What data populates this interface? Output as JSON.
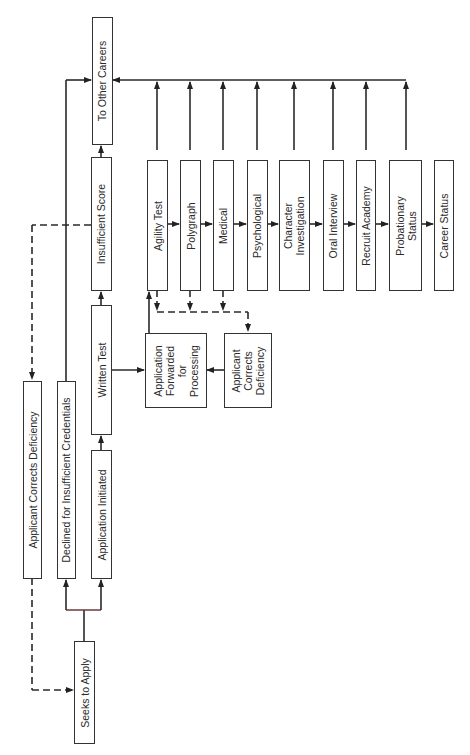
{
  "diagram": {
    "type": "flowchart",
    "orientation": "rotated-90-ccw",
    "nodes": {
      "to_other_careers": "To Other Careers",
      "insufficient_score": "Insufficient Score",
      "written_test": "Written Test",
      "application_initiated": "Application Initiated",
      "declined": "Declined for Insufficient Credentials",
      "applicant_corrects_1": "Applicant Corrects Deficiency",
      "seeks_to_apply": "Seeks to Apply",
      "app_forwarded": [
        "Application",
        "Forwarded",
        "for",
        "Processing"
      ],
      "applicant_corrects_2": [
        "Applicant",
        "Corrects",
        "Deficiency"
      ],
      "agility_test": "Agility Test",
      "polygraph": "Polygraph",
      "medical": "Medical",
      "psychological": "Psychological",
      "character_investigation": [
        "Character",
        "Investigation"
      ],
      "oral_interview": "Oral Interview",
      "recruit_academy": "Recruit Academy",
      "probationary_status": [
        "Probationary",
        "Status"
      ],
      "career_status": "Career Status"
    },
    "edges": [
      {
        "from": "Seeks to Apply",
        "to": "Declined for Insufficient Credentials",
        "style": "solid"
      },
      {
        "from": "Seeks to Apply",
        "to": "Application Initiated",
        "style": "solid"
      },
      {
        "from": "Declined for Insufficient Credentials",
        "to": "To Other Careers",
        "style": "solid"
      },
      {
        "from": "Application Initiated",
        "to": "Written Test",
        "style": "solid"
      },
      {
        "from": "Written Test",
        "to": "Insufficient Score",
        "style": "solid"
      },
      {
        "from": "Insufficient Score",
        "to": "To Other Careers",
        "style": "solid"
      },
      {
        "from": "Insufficient Score",
        "to": "Applicant Corrects Deficiency",
        "style": "dashed"
      },
      {
        "from": "Applicant Corrects Deficiency",
        "to": "Seeks to Apply",
        "style": "dashed"
      },
      {
        "from": "Written Test",
        "to": "Application Forwarded for Processing",
        "style": "solid"
      },
      {
        "from": "Application Forwarded for Processing",
        "to": "Agility Test",
        "style": "solid"
      },
      {
        "from": "Agility Test",
        "to": "Polygraph",
        "style": "solid"
      },
      {
        "from": "Polygraph",
        "to": "Medical",
        "style": "solid"
      },
      {
        "from": "Medical",
        "to": "Psychological",
        "style": "solid"
      },
      {
        "from": "Psychological",
        "to": "Character Investigation",
        "style": "solid"
      },
      {
        "from": "Character Investigation",
        "to": "Oral Interview",
        "style": "solid"
      },
      {
        "from": "Oral Interview",
        "to": "Recruit Academy",
        "style": "solid"
      },
      {
        "from": "Recruit Academy",
        "to": "Probationary Status",
        "style": "solid"
      },
      {
        "from": "Probationary Status",
        "to": "Career Status",
        "style": "solid"
      },
      {
        "from": "Agility Test / Polygraph / Medical / Psychological / Character Investigation / Oral Interview / Recruit Academy / Probationary Status",
        "to": "To Other Careers",
        "style": "solid"
      },
      {
        "from": "Agility Test / Polygraph / Medical",
        "to": "Applicant Corrects Deficiency (2)",
        "style": "dashed"
      },
      {
        "from": "Applicant Corrects Deficiency (2)",
        "to": "Application Forwarded for Processing",
        "style": "solid"
      }
    ]
  }
}
